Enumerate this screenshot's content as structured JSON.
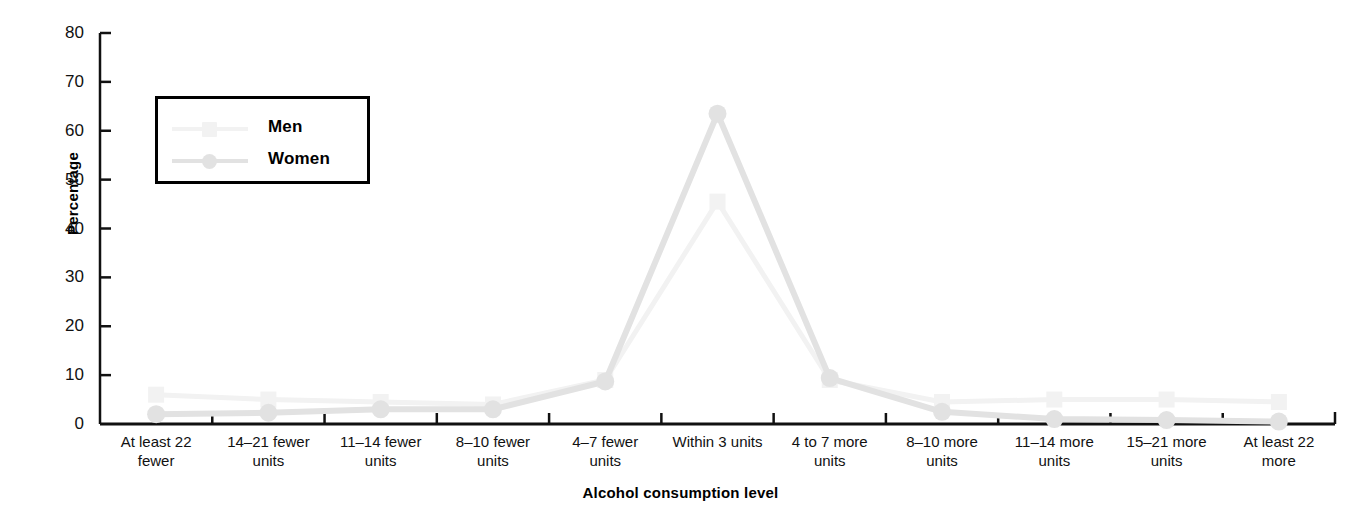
{
  "chart_data": {
    "type": "line",
    "title": "",
    "xlabel": "Alcohol consumption level",
    "ylabel": "Percentage",
    "ylim": [
      0,
      80
    ],
    "yticks": [
      0,
      10,
      20,
      30,
      40,
      50,
      60,
      70,
      80
    ],
    "grid": false,
    "legend_position": "upper-left-inside",
    "categories": [
      "At least 22\nfewer",
      "14–21 fewer\nunits",
      "11–14 fewer\nunits",
      "8–10 fewer\nunits",
      "4–7 fewer\nunits",
      "Within 3 units",
      "4 to 7 more\nunits",
      "8–10 more\nunits",
      "11–14 more\nunits",
      "15–21 more\nunits",
      "At least 22\nmore"
    ],
    "series": [
      {
        "name": "Men",
        "marker": "square",
        "color": "#f2f2f2",
        "values": [
          6.0,
          5.0,
          4.5,
          4.0,
          9.0,
          45.5,
          9.0,
          4.5,
          5.0,
          5.0,
          4.5
        ]
      },
      {
        "name": "Women",
        "marker": "circle",
        "color": "#e2e2e2",
        "values": [
          2.0,
          2.3,
          3.0,
          3.0,
          8.7,
          63.5,
          9.4,
          2.5,
          1.0,
          0.8,
          0.5
        ]
      }
    ]
  },
  "legend": {
    "entries": [
      {
        "label": "Men"
      },
      {
        "label": "Women"
      }
    ]
  },
  "axes": {
    "y_label": "Percentage",
    "x_label": "Alcohol consumption level",
    "y_tick_labels": [
      "80",
      "70",
      "60",
      "50",
      "40",
      "30",
      "20",
      "10",
      "0"
    ]
  },
  "colors": {
    "men_line": "#f2f2f2",
    "women_line": "#e2e2e2",
    "axis": "#111111",
    "background": "#ffffff"
  }
}
